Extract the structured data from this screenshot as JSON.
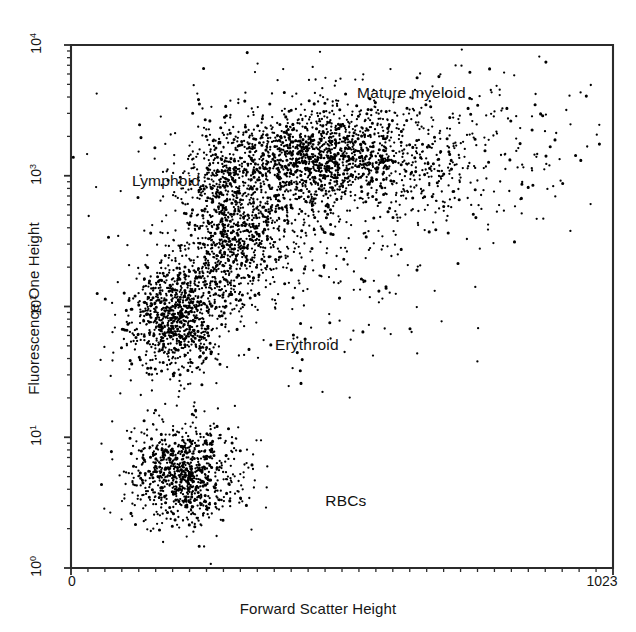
{
  "chart_data": {
    "type": "scatter",
    "title": "",
    "subtitle": "",
    "xlabel": "Forward Scatter Height",
    "ylabel": "Fluorescence One Height",
    "xscale": "linear",
    "yscale": "log",
    "xlim": [
      0,
      1023
    ],
    "ylim": [
      1,
      10000
    ],
    "grid": false,
    "legend_position": "none",
    "xticklabels": [
      "0",
      "1023"
    ],
    "xtickvalues": [
      0,
      1023
    ],
    "x_minor_tick_count": 32,
    "yticklabels": [
      "10⁰",
      "10¹",
      "10²",
      "10³",
      "10⁴"
    ],
    "ytickvalues": [
      1,
      10,
      100,
      1000,
      10000
    ],
    "y_decade_labels": [
      {
        "mantissa": "10",
        "exponent": "0",
        "value": 1
      },
      {
        "mantissa": "10",
        "exponent": "1",
        "value": 10
      },
      {
        "mantissa": "10",
        "exponent": "2",
        "value": 100
      },
      {
        "mantissa": "10",
        "exponent": "3",
        "value": 1000
      },
      {
        "mantissa": "10",
        "exponent": "4",
        "value": 10000
      }
    ],
    "marker_color": "#000000",
    "frame_color": "#2b2b2b",
    "background_color": "#ffffff",
    "annotations": [
      {
        "text": "Mature myeloid",
        "x": 540,
        "y": 4200
      },
      {
        "text": "Lymphoid",
        "x": 115,
        "y": 900
      },
      {
        "text": "Erythroid",
        "x": 385,
        "y": 50
      },
      {
        "text": "RBCs",
        "x": 480,
        "y": 3.2
      }
    ],
    "populations": [
      {
        "name": "RBCs",
        "n": 900,
        "x_mean": 215,
        "x_sd": 52,
        "y_mean_log10": 0.72,
        "y_sd_log10": 0.19,
        "description": "Dense low-fluorescence cluster near bottom-left"
      },
      {
        "name": "Lymphoid",
        "n": 850,
        "x_mean": 195,
        "x_sd": 42,
        "y_mean_log10": 1.92,
        "y_sd_log10": 0.21,
        "description": "Dense cluster at low forward scatter, ~10^2 fluorescence"
      },
      {
        "name": "Erythroid",
        "n": 420,
        "x_mean": 300,
        "x_sd": 46,
        "y_mean_log10": 2.45,
        "y_sd_log10": 0.22,
        "description": "Intermediate cluster bridging lymphoid to myeloid"
      },
      {
        "name": "Erythroid-upper",
        "n": 330,
        "x_mean": 290,
        "x_sd": 40,
        "y_mean_log10": 2.92,
        "y_sd_log10": 0.18,
        "description": "Upper erythroid node"
      },
      {
        "name": "Mature myeloid",
        "n": 1150,
        "x_mean": 470,
        "x_sd": 95,
        "y_mean_log10": 3.15,
        "y_sd_log10": 0.18,
        "description": "Broad horizontal band around 10^3 fluorescence"
      },
      {
        "name": "Myeloid-tail",
        "n": 480,
        "x_mean": 650,
        "x_sd": 150,
        "y_mean_log10": 3.2,
        "y_sd_log10": 0.3,
        "description": "Sparse tail extending to high forward scatter"
      },
      {
        "name": "Diffuse-background",
        "n": 520,
        "x_mean": 400,
        "x_sd": 170,
        "y_mean_log10": 2.6,
        "y_sd_log10": 0.55,
        "description": "Scattered background events across mid plot"
      }
    ]
  },
  "axes": {
    "y_title": "Fluorescence One Height",
    "x_title": "Forward Scatter Height",
    "x_min_label": "0",
    "x_max_label": "1023"
  }
}
